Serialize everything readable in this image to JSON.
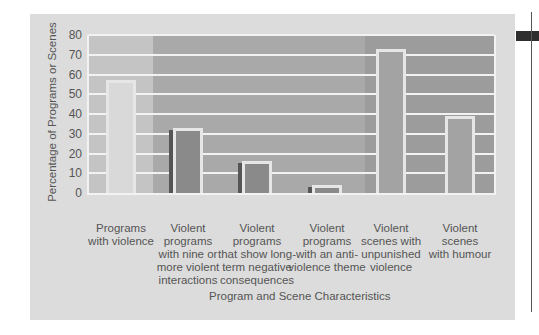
{
  "chart_data": {
    "type": "bar",
    "title": "",
    "xlabel": "Program and Scene Characteristics",
    "ylabel": "Percentage of Programs or Scenes",
    "ylim": [
      0,
      80
    ],
    "yticks": [
      0,
      10,
      20,
      30,
      40,
      50,
      60,
      70,
      80
    ],
    "grid": true,
    "legend": null,
    "categories": [
      "Programs with violence",
      "Violent programs with nine or more violent interactions",
      "Violent programs that show long-term negative consequences",
      "Violent programs with an anti-violence theme",
      "Violent scenes with unpunished violence",
      "Violent scenes with humour"
    ],
    "category_lines": [
      [
        "Programs",
        "with violence"
      ],
      [
        "Violent",
        "programs",
        "with nine or",
        "more violent",
        "interactions"
      ],
      [
        "Violent",
        "programs",
        "that show long-",
        "term negative",
        "consequences"
      ],
      [
        "Violent",
        "programs",
        "with an anti-",
        "violence theme"
      ],
      [
        "Violent",
        "scenes with",
        "unpunished",
        "violence"
      ],
      [
        "Violent",
        "scenes",
        "with humour"
      ]
    ],
    "values": [
      57,
      33,
      16,
      4,
      73,
      39
    ]
  },
  "ticks": [
    "80",
    "70",
    "60",
    "50",
    "40",
    "30",
    "20",
    "10",
    "0"
  ],
  "colors": {
    "panel_bg": "#dcdcdc",
    "band_1": "#c4c4c4",
    "band_2": "#a9a9a9",
    "band_3": "#9c9c9c",
    "gridline": "#f2f2f2",
    "bar_1": "#d9d9d9",
    "bar_2": "#8a8a8a",
    "bar_3": "#8a8a8a",
    "bar_4": "#8a8a8a",
    "bar_5": "#a3a3a3",
    "bar_6": "#a3a3a3"
  }
}
